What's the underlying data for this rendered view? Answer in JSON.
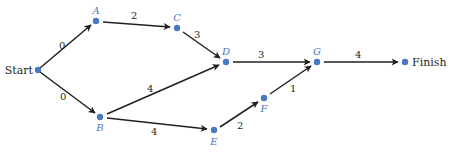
{
  "diagram": {
    "type": "activity-network",
    "colors": {
      "node": "#4a78c2",
      "edge": "#231f20",
      "label": "#4a78c2",
      "text": "#231f20"
    },
    "nodes": [
      {
        "id": "Start",
        "label": "Start",
        "x": 38,
        "y": 70
      },
      {
        "id": "A",
        "label": "A",
        "x": 96,
        "y": 21
      },
      {
        "id": "B",
        "label": "B",
        "x": 100,
        "y": 117
      },
      {
        "id": "C",
        "label": "C",
        "x": 177,
        "y": 28
      },
      {
        "id": "D",
        "label": "D",
        "x": 226,
        "y": 62
      },
      {
        "id": "E",
        "label": "E",
        "x": 214,
        "y": 130
      },
      {
        "id": "F",
        "label": "F",
        "x": 264,
        "y": 98
      },
      {
        "id": "G",
        "label": "G",
        "x": 317,
        "y": 62
      },
      {
        "id": "Finish",
        "label": "Finish",
        "x": 405,
        "y": 62
      }
    ],
    "edges": [
      {
        "from": "Start",
        "to": "A",
        "weight": "0"
      },
      {
        "from": "Start",
        "to": "B",
        "weight": "0"
      },
      {
        "from": "A",
        "to": "C",
        "weight": "2"
      },
      {
        "from": "C",
        "to": "D",
        "weight": "3"
      },
      {
        "from": "B",
        "to": "D",
        "weight": "4"
      },
      {
        "from": "B",
        "to": "E",
        "weight": "4"
      },
      {
        "from": "D",
        "to": "G",
        "weight": "3"
      },
      {
        "from": "E",
        "to": "F",
        "weight": "2"
      },
      {
        "from": "F",
        "to": "G",
        "weight": "1"
      },
      {
        "from": "G",
        "to": "Finish",
        "weight": "4"
      }
    ]
  }
}
